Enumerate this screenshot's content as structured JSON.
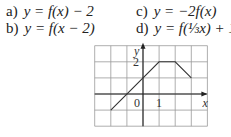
{
  "exercise": {
    "parts": [
      {
        "label": "a)",
        "expression": "y = f(x) − 2"
      },
      {
        "label": "b)",
        "expression": "y = f(x − 2)"
      },
      {
        "label": "c)",
        "expression": "y = −2f(x)"
      },
      {
        "label": "d)",
        "expression": "y = f(⅓x) + 1"
      }
    ]
  },
  "chart_data": {
    "type": "line",
    "title": "",
    "xlabel": "x",
    "ylabel": "y",
    "x_tick_labels": [
      "0",
      "1"
    ],
    "y_tick_labels": [
      "2"
    ],
    "xlim": [
      -3,
      4
    ],
    "ylim": [
      -2,
      3
    ],
    "grid": true,
    "series": [
      {
        "name": "f",
        "x": [
          -2,
          1,
          2,
          3
        ],
        "y": [
          -1,
          2,
          2,
          1
        ]
      }
    ]
  }
}
